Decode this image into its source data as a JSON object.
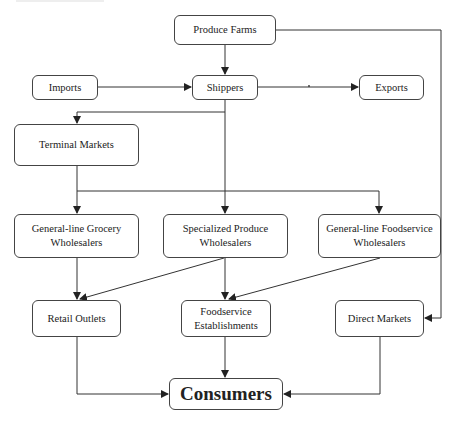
{
  "diagram": {
    "type": "flowchart",
    "nodes": {
      "produce_farms": {
        "label": "Produce Farms"
      },
      "imports": {
        "label": "Imports"
      },
      "shippers": {
        "label": "Shippers"
      },
      "exports": {
        "label": "Exports"
      },
      "terminal_markets": {
        "label": "Terminal Markets"
      },
      "grocery_wholesalers": {
        "label": "General-line Grocery Wholesalers"
      },
      "specialized_wholesalers": {
        "label": "Specialized Produce Wholesalers"
      },
      "foodservice_wholesalers": {
        "label": "General-line Foodservice Wholesalers"
      },
      "retail_outlets": {
        "label": "Retail Outlets"
      },
      "foodservice_establishments": {
        "label": "Foodservice Establishments"
      },
      "direct_markets": {
        "label": "Direct Markets"
      },
      "consumers": {
        "label": "Consumers"
      }
    },
    "edges": [
      {
        "from": "Produce Farms",
        "to": "Shippers"
      },
      {
        "from": "Produce Farms",
        "to": "Direct Markets"
      },
      {
        "from": "Imports",
        "to": "Shippers"
      },
      {
        "from": "Shippers",
        "to": "Exports"
      },
      {
        "from": "Shippers",
        "to": "Terminal Markets"
      },
      {
        "from": "Shippers",
        "to": "Specialized Produce Wholesalers"
      },
      {
        "from": "Terminal Markets",
        "to": "General-line Grocery Wholesalers"
      },
      {
        "from": "Terminal Markets",
        "to": "Specialized Produce Wholesalers"
      },
      {
        "from": "Terminal Markets",
        "to": "General-line Foodservice Wholesalers"
      },
      {
        "from": "General-line Grocery Wholesalers",
        "to": "Retail Outlets"
      },
      {
        "from": "Specialized Produce Wholesalers",
        "to": "Retail Outlets"
      },
      {
        "from": "Specialized Produce Wholesalers",
        "to": "Foodservice Establishments"
      },
      {
        "from": "General-line Foodservice Wholesalers",
        "to": "Foodservice Establishments"
      },
      {
        "from": "Retail Outlets",
        "to": "Consumers"
      },
      {
        "from": "Foodservice Establishments",
        "to": "Consumers"
      },
      {
        "from": "Direct Markets",
        "to": "Consumers"
      }
    ]
  },
  "colors": {
    "line": "#333333",
    "border": "#444444",
    "text": "#222222",
    "background": "#ffffff"
  }
}
